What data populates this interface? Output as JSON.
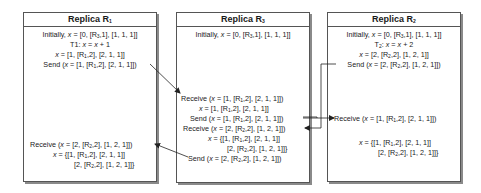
{
  "replica_r1": {
    "title": "Replica R",
    "title_sub": "1",
    "lines": [
      {
        "pre": "Initially, ",
        "x": "x",
        "mid": " = [0, [R",
        "sub": "3",
        "post": ",1], [1, 1, 1]]"
      },
      {
        "pre": "T1: ",
        "x": "x",
        "mid": " = ",
        "x2": "x",
        "post": " + 1"
      },
      {
        "x": "x",
        "mid": " = [1, [R",
        "sub": "1",
        "post": ",2], [2, 1, 1]]"
      },
      {
        "pre": "Send (",
        "x": "x",
        "mid": " = [1, [R",
        "sub": "1",
        "post": ",2], [2, 1, 1]])"
      },
      {
        "pre": "Receive (",
        "x": "x",
        "mid": " = [2, [R",
        "sub": "2",
        "post": ",2], [1, 2, 1]])"
      },
      {
        "x": "x",
        "mid": " = {[1, [R",
        "sub": "1",
        "post": ",2], [2, 1, 1]]"
      },
      {
        "mid": "[2, [R",
        "sub": "2",
        "post": ",2], [1, 2, 1]]}"
      }
    ]
  },
  "replica_r3": {
    "title": "Replica R",
    "title_sub": "3",
    "lines": [
      {
        "pre": "Initially, ",
        "x": "x",
        "mid": " = [0, [R",
        "sub": "3",
        "post": ",1], [1, 1, 1]]"
      },
      {
        "pre": "Receive (",
        "x": "x",
        "mid": " = [1, [R",
        "sub": "1",
        "post": ",2], [2, 1, 1]])"
      },
      {
        "x": "x",
        "mid": " = [1, [R",
        "sub": "1",
        "post": ",2], [2, 1, 1]]"
      },
      {
        "pre": "Send (",
        "x": "x",
        "mid": " = [1, [R",
        "sub": "1",
        "post": ",2], [2, 1, 1]])"
      },
      {
        "pre": "Receive (",
        "x": "x",
        "mid": " = [2, [R",
        "sub": "2",
        "post": ",2], [1, 2, 1]])"
      },
      {
        "x": "x",
        "mid": " = {[1, [R",
        "sub": "1",
        "post": ",2], [2, 1, 1]]"
      },
      {
        "mid": "[2, [R",
        "sub": "2",
        "post": ",2], [1, 2, 1]]}"
      },
      {
        "pre": "Send (",
        "x": "x",
        "mid": " = [2, [R",
        "sub": "2",
        "post": ",2], [1, 2, 1]])"
      }
    ]
  },
  "replica_r2": {
    "title": "Replica R",
    "title_sub": "2",
    "lines": [
      {
        "pre": "Initially, ",
        "x": "x",
        "mid": " = [0, [R",
        "sub": "3",
        "post": ",1], [1, 1, 1]]"
      },
      {
        "pre": "T",
        "sub0": "2",
        "pre2": ": ",
        "x": "x",
        "mid": " = ",
        "x2": "x",
        "post": " + 2"
      },
      {
        "x": "x",
        "mid": " = [2, [R",
        "sub": "2",
        "post": ",2], [1, 2, 1]]"
      },
      {
        "pre": "Send (",
        "x": "x",
        "mid": " = [2, [R",
        "sub": "2",
        "post": ",2], [1, 2, 1]])"
      },
      {
        "pre": "Receive (",
        "x": "x",
        "mid": " = [1, [R",
        "sub": "1",
        "post": ",2], [2, 1, 1]])"
      },
      {
        "x": "x",
        "mid": " = {[1, [R",
        "sub": "1",
        "post": ",2], [2, 1, 1]]"
      },
      {
        "mid": "[2, [R",
        "sub": "2",
        "post": ",2], [1, 2, 1]]}"
      }
    ]
  },
  "colors": {
    "border": "#555555",
    "shadow": "#8a8a8a",
    "arrow": "#222222",
    "text": "#1a1a1a"
  }
}
